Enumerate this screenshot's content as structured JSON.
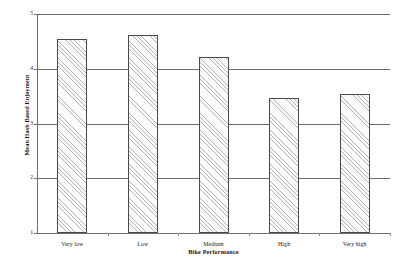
{
  "chart_data": {
    "type": "bar",
    "title": "",
    "xlabel": "Bike Performance",
    "ylabel": "Mean Hash Based Enjoyment",
    "categories": [
      "Very low",
      "Low",
      "Medium",
      "High",
      "Very high"
    ],
    "values": [
      4.55,
      4.62,
      4.22,
      3.46,
      3.53
    ],
    "ylim": [
      1,
      5
    ],
    "yticks": [
      1,
      2,
      3,
      4,
      5
    ],
    "ytick_labels": [
      "1",
      "2",
      "3",
      "4",
      "5"
    ],
    "grid": true,
    "legend": "none",
    "bar_style": {
      "fill": "#fbfbfb",
      "hatch": "diagonal-45",
      "edge_color": "#4a4a4a"
    },
    "axis_color": "#6e6e6e",
    "background": "#ffffff"
  },
  "axes": {
    "y_title": "Mean Hash Based Enjoyment",
    "x_title": "Bike Performance"
  }
}
